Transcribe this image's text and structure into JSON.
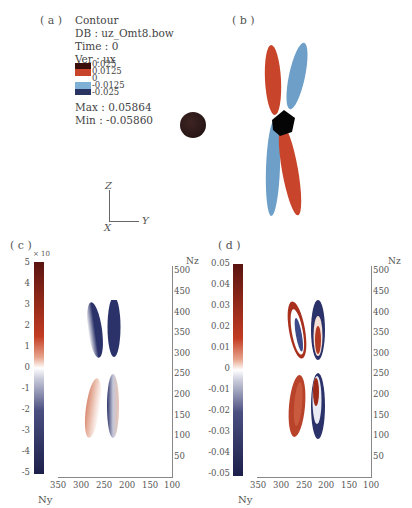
{
  "panel_a": {
    "label": "( a )",
    "info_lines": [
      "Contour",
      "DB : uz_Omt8.bow",
      "Time : 0",
      "Ver : ux"
    ],
    "legend_levels": [
      "0.025",
      "0.0125",
      "0",
      "-0.0125",
      "-0.025"
    ],
    "legend_colors": [
      "#3a0e0a",
      "#c8452b",
      "#7fb0d6",
      "#2a3463"
    ],
    "max_label": "Max : 0.05864",
    "min_label": "Min : -0.05860",
    "sphere_color": "#2a1816"
  },
  "panel_b": {
    "label": "( b )",
    "colors": {
      "red": "#c8452b",
      "blue": "#6e9fc8",
      "core": "#000000"
    }
  },
  "axes_triad": {
    "z": "Z",
    "y": "Y",
    "x": "X"
  },
  "panel_c": {
    "label": "( c )",
    "colorbar_exponent": "× 10",
    "colorbar_ticks": [
      "5",
      "4",
      "3",
      "2",
      "1",
      "0",
      "-1",
      "-2",
      "-3",
      "-4",
      "-5"
    ],
    "xaxis_ticks": [
      "350",
      "300",
      "250",
      "200",
      "150",
      "100"
    ],
    "yaxis_ticks": [
      "500",
      "450",
      "400",
      "350",
      "300",
      "250",
      "200",
      "150",
      "100",
      "50"
    ],
    "xlabel": "Ny",
    "ylabel": "Nz"
  },
  "panel_d": {
    "label": "( d )",
    "colorbar_ticks": [
      "0.05",
      "0.04",
      "0.03",
      "0.02",
      "0.01",
      "0",
      "-0.01",
      "-0.02",
      "-0.03",
      "-0.04",
      "-0.05"
    ],
    "xaxis_ticks": [
      "350",
      "300",
      "250",
      "200",
      "150",
      "100"
    ],
    "yaxis_ticks": [
      "500",
      "450",
      "400",
      "350",
      "300",
      "250",
      "200",
      "150",
      "100",
      "50"
    ],
    "xlabel": "Ny",
    "ylabel": "Nz"
  },
  "colors": {
    "pos_dark": "#5a1410",
    "pos": "#c23b22",
    "zero": "#ffffff",
    "neg": "#2b3269",
    "neg_dark": "#1c1f4a"
  }
}
